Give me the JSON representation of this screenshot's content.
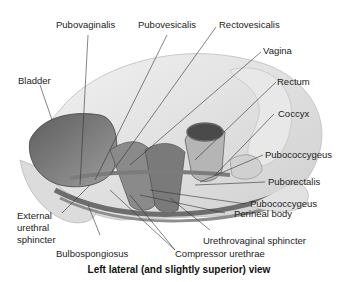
{
  "figure": {
    "caption": "Left lateral (and slightly superior) view",
    "labels": {
      "pubovaginalis": "Pubovaginalis",
      "pubovesicalis": "Pubovesicalis",
      "rectovesicalis": "Rectovesicalis",
      "vagina": "Vagina",
      "bladder": "Bladder",
      "rectum": "Rectum",
      "coccyx": "Coccyx",
      "pubococcygeus_upper": "Pubococcygeus",
      "puborectalis": "Puborectalis",
      "pubococcygeus_lower": "Pubococcygeus",
      "perineal_body": "Perineal body",
      "external_urethral_sphincter_1": "External",
      "external_urethral_sphincter_2": "urethral",
      "external_urethral_sphincter_3": "sphincter",
      "urethrovaginal_sphincter": "Urethrovaginal sphincter",
      "bulbospongiosus": "Bulbospongiosus",
      "compressor_urethrae": "Compressor urethrae"
    },
    "colors": {
      "background": "#ffffff",
      "bone": "#e4e4e4",
      "tissue_dark": "#6a6a6a",
      "tissue_mid": "#9a9a9a",
      "leader_line": "#333333"
    }
  }
}
